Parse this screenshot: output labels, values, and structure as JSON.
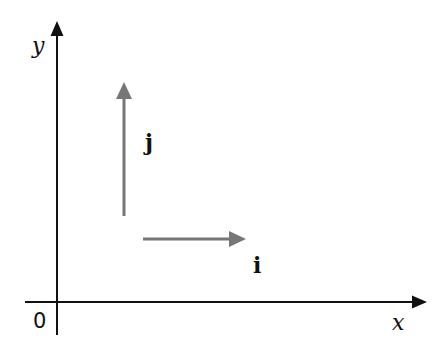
{
  "diagram": {
    "type": "coordinate-axes-with-unit-vectors",
    "axes": {
      "x_label": "x",
      "y_label": "y",
      "origin_label": "0",
      "color": "#111111"
    },
    "vectors": [
      {
        "id": "i",
        "label": "i",
        "direction": "positive-x",
        "color": "#777777"
      },
      {
        "id": "j",
        "label": "j",
        "direction": "positive-y",
        "color": "#777777"
      }
    ]
  }
}
